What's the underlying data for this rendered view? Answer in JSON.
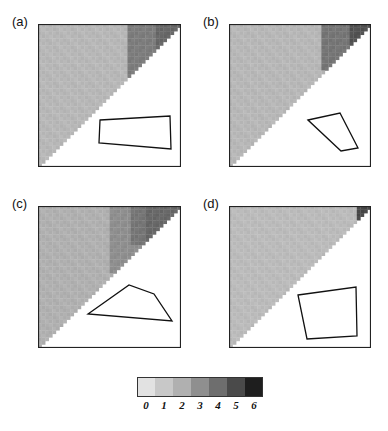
{
  "chart_data": {
    "type": "heatmap",
    "grid_size": 40,
    "panels": [
      {
        "label": "(a)",
        "box": {
          "x": 38,
          "y": 24,
          "w": 143,
          "h": 143
        },
        "base_level": 1.3,
        "hot_regions": [
          {
            "col_from": 25,
            "row_to": 20,
            "level": 3.0
          },
          {
            "col_from": 33,
            "row_to": 8,
            "level": 3.6
          }
        ],
        "polygon": [
          [
            100,
            120
          ],
          [
            170,
            116
          ],
          [
            171,
            149
          ],
          [
            99,
            143
          ]
        ]
      },
      {
        "label": "(b)",
        "box": {
          "x": 229,
          "y": 24,
          "w": 142,
          "h": 143
        },
        "base_level": 1.3,
        "hot_regions": [
          {
            "col_from": 26,
            "row_to": 12,
            "level": 3.2
          },
          {
            "col_from": 34,
            "row_to": 6,
            "level": 4.2
          }
        ],
        "polygon": [
          [
            308,
            120
          ],
          [
            340,
            113
          ],
          [
            358,
            148
          ],
          [
            341,
            151
          ]
        ]
      },
      {
        "label": "(c)",
        "box": {
          "x": 38,
          "y": 206,
          "w": 143,
          "h": 142
        },
        "base_level": 1.5,
        "hot_regions": [
          {
            "col_from": 20,
            "row_to": 18,
            "level": 2.5
          },
          {
            "col_from": 26,
            "row_to": 10,
            "level": 3.2
          },
          {
            "col_from": 30,
            "row_to": 14,
            "level": 3.6
          }
        ],
        "polygon": [
          [
            88,
            314
          ],
          [
            129,
            285
          ],
          [
            154,
            294
          ],
          [
            172,
            321
          ]
        ]
      },
      {
        "label": "(d)",
        "box": {
          "x": 229,
          "y": 206,
          "w": 142,
          "h": 142
        },
        "base_level": 1.2,
        "hot_regions": [
          {
            "col_from": 36,
            "row_to": 3,
            "level": 4.5
          }
        ],
        "polygon": [
          [
            298,
            295
          ],
          [
            356,
            287
          ],
          [
            357,
            336
          ],
          [
            307,
            339
          ]
        ]
      }
    ],
    "colorbar": {
      "ticks": [
        "0",
        "1",
        "2",
        "3",
        "4",
        "5",
        "6"
      ],
      "range": [
        0,
        6
      ],
      "colors": [
        "#e2e2e2",
        "#c8c8c8",
        "#b0b0b0",
        "#8f8f8f",
        "#6e6e6e",
        "#4a4a4a",
        "#1e1e1e"
      ]
    },
    "title": "",
    "xlabel": "",
    "ylabel": ""
  }
}
